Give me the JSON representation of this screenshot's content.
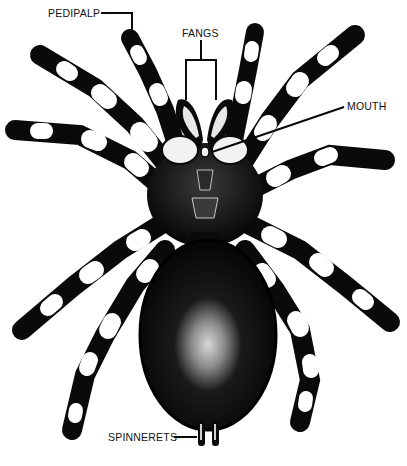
{
  "diagram": {
    "subject": "Tarantula, ventral view",
    "ink_color": "#0a0a0a",
    "paper_color": "#ffffff",
    "labels": [
      {
        "id": "pedipalp",
        "text": "PEDIPALP",
        "x": 48,
        "y": 9
      },
      {
        "id": "fangs",
        "text": "FANGS",
        "x": 182,
        "y": 29
      },
      {
        "id": "mouth",
        "text": "MOUTH",
        "x": 347,
        "y": 103
      },
      {
        "id": "spinnerets",
        "text": "SPINNERETS",
        "x": 108,
        "y": 432
      }
    ]
  }
}
